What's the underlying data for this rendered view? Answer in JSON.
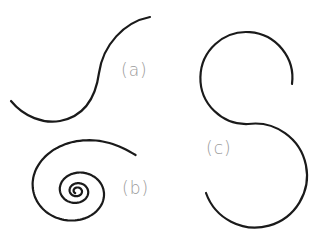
{
  "figure": {
    "background": "#ffffff",
    "stroke_color": "#1a1a1a",
    "stroke_width": 2.2,
    "label_color": "#9a9a9a",
    "panels": [
      {
        "id": "a",
        "label": "(a)",
        "description": "S-shaped curve made of two opposite arcs",
        "label_pos": {
          "x": 121,
          "y": 60
        },
        "path": "M11,101 C24,117 44,124 60,121 C86,116 96,95 99,73 C103,45 124,22 150,17"
      },
      {
        "id": "b",
        "label": "(b)",
        "description": "Spiral winding inward",
        "label_pos": {
          "x": 122,
          "y": 178
        },
        "path": ""
      },
      {
        "id": "c",
        "label": "(c)",
        "description": "Two tangent circular arcs forming an S shape",
        "label_pos": {
          "x": 206,
          "y": 138
        },
        "path": "M292,84 A46,46 0 1 0 248,124 A52,52 0 1 1 206,193"
      }
    ]
  }
}
